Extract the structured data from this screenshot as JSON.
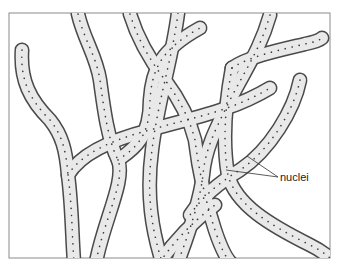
{
  "figure": {
    "labels": [
      {
        "text": "nuclei",
        "x": 280,
        "y": 171
      }
    ],
    "colors": {
      "frame": "#8a8a8a",
      "hypha_fill": "#e6e6e6",
      "hypha_outline": "#4a4a4a",
      "nucleus": "#3a3a3a",
      "leader_line": "#333333"
    }
  }
}
